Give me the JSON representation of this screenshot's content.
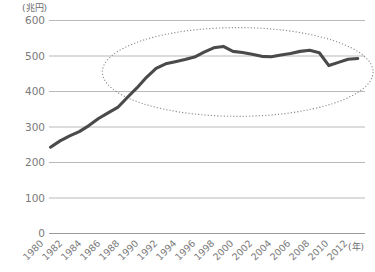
{
  "chart_data": {
    "type": "line",
    "title": "",
    "subtitle": "",
    "xlabel": "(年)",
    "ylabel": "(兆円)",
    "ylim": [
      0,
      600
    ],
    "xlim": [
      1980,
      2013
    ],
    "grid": true,
    "legend": false,
    "y_ticks": [
      0,
      100,
      200,
      300,
      400,
      500,
      600
    ],
    "y_tick_labels": [
      "0",
      "100",
      "200",
      "300",
      "400",
      "500",
      "600"
    ],
    "x_ticks": [
      1980,
      1982,
      1984,
      1986,
      1988,
      1990,
      1992,
      1994,
      1996,
      1998,
      2000,
      2002,
      2004,
      2006,
      2008,
      2010,
      2012
    ],
    "x_tick_labels": [
      "1980",
      "1982",
      "1984",
      "1986",
      "1988",
      "1990",
      "1992",
      "1994",
      "1996",
      "1998",
      "2000",
      "2002",
      "2004",
      "2006",
      "2008",
      "2010",
      "2012"
    ],
    "x": [
      1980,
      1981,
      1982,
      1983,
      1984,
      1985,
      1986,
      1987,
      1988,
      1989,
      1990,
      1991,
      1992,
      1993,
      1994,
      1995,
      1996,
      1997,
      1998,
      1999,
      2000,
      2001,
      2002,
      2003,
      2004,
      2005,
      2006,
      2007,
      2008,
      2009,
      2010,
      2011,
      2012
    ],
    "values": [
      243,
      261,
      275,
      287,
      304,
      324,
      340,
      355,
      383,
      410,
      440,
      465,
      478,
      484,
      490,
      497,
      511,
      523,
      527,
      513,
      510,
      505,
      499,
      498,
      503,
      507,
      513,
      516,
      509,
      473,
      482,
      491,
      493
    ],
    "series": [
      {
        "name": "名目GDP",
        "color": "#4a4a4a",
        "values": [
          243,
          261,
          275,
          287,
          304,
          324,
          340,
          355,
          383,
          410,
          440,
          465,
          478,
          484,
          490,
          497,
          511,
          523,
          527,
          513,
          510,
          505,
          499,
          498,
          503,
          507,
          513,
          516,
          509,
          473,
          482,
          491,
          493
        ]
      }
    ],
    "annotations": [
      {
        "type": "ellipse",
        "name": "plateau-highlight",
        "style": "dotted",
        "x_range": [
          1985.4,
          2013.6
        ],
        "y_range": [
          330,
          580
        ],
        "color": "#8a8a8a"
      }
    ]
  }
}
